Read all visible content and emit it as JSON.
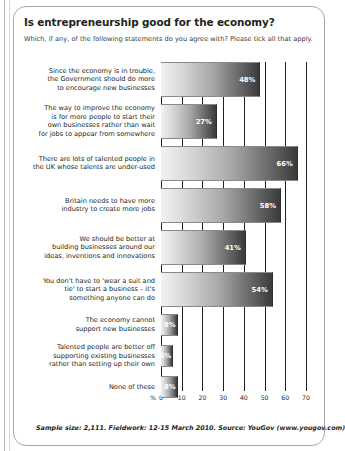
{
  "card": {
    "title": "Is entrepreneurship good for the economy?",
    "subtitle": "Which, if any, of the following statements do you agree with? Please tick all that apply.",
    "footer": "Sample size: 2,111. Fieldwork: 12-15 March 2010. Source: YouGov (www.yougov.com)"
  },
  "chart_data": {
    "type": "bar",
    "orientation": "horizontal",
    "title": "Is entrepreneurship good for the economy?",
    "subtitle": "Which, if any, of the following statements do you agree with? Please tick all that apply.",
    "xlabel": "%",
    "ylabel": "",
    "xlim": [
      0,
      70
    ],
    "xticks": [
      0,
      10,
      20,
      30,
      40,
      50,
      60,
      70
    ],
    "xticklabels": [
      "0",
      "10",
      "20",
      "30",
      "40",
      "50",
      "60",
      "70"
    ],
    "grid": true,
    "legend": false,
    "value_suffix": "%",
    "categories": [
      "Since the economy is in trouble,\nthe Government should do more\nto encourage new businesses",
      "The way to improve the economy\nis for more people to start their\nown businesses rather than wait\nfor jobs to appear from somewhere",
      "There are lots of talented people in\nthe UK whose talents are under-used",
      "Britain needs to have more\nindustry to create more jobs",
      "We should be better at\nbuilding businesses around our\nideas, inventions and innovations",
      "You don't have to 'wear a suit and\ntie' to start a business – it's\nsomething anyone can do",
      "The economy cannot\nsupport new businesses",
      "Talented people are better off\nsupporting existing businesses\nrather than setting up their own",
      "None of these"
    ],
    "values": [
      48,
      27,
      66,
      58,
      41,
      54,
      8,
      6,
      8
    ],
    "value_labels": [
      "48%",
      "27%",
      "66%",
      "58%",
      "41%",
      "54%",
      "8%",
      "6%",
      "8%"
    ]
  }
}
